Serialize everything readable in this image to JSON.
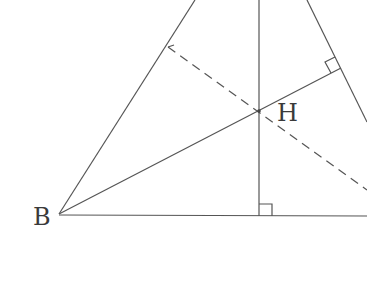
{
  "diagram": {
    "type": "triangle-orthocenter",
    "labels": {
      "B": "B",
      "H": "H"
    },
    "colors": {
      "stroke": "#555555",
      "label": "#3a3a3a",
      "background": "#ffffff"
    },
    "elements": [
      "side AB",
      "side BC",
      "side AC",
      "altitude from A to BC (solid, right-angle mark)",
      "altitude from B to AC (solid, right-angle mark)",
      "altitude from C to AB (dashed)",
      "orthocenter H"
    ]
  }
}
